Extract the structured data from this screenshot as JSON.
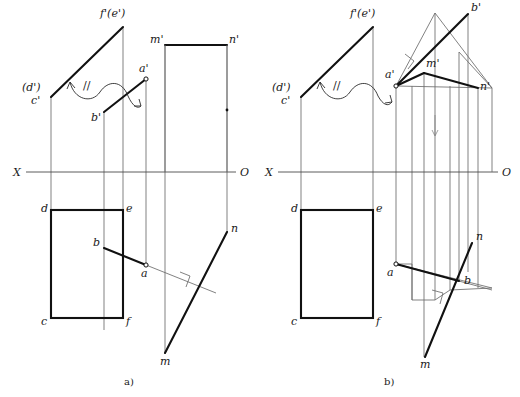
{
  "figure": {
    "width": 520,
    "height": 397,
    "background": "#ffffff",
    "line_color": "#111111",
    "thin_line_color": "#6b6b6b",
    "axis_color": "#4a4a4a"
  },
  "panels": [
    {
      "id": "a",
      "caption": "a)",
      "caption_pos": {
        "x": 124,
        "y": 385
      },
      "axis": {
        "label_left": "X",
        "label_right": "O",
        "label_left_pos": {
          "x": 13,
          "y": 176
        },
        "label_right_pos": {
          "x": 240,
          "y": 176
        },
        "y": 172,
        "x_start": 26,
        "x_end": 236
      },
      "points": [
        {
          "name": "f'(e')",
          "x": 123,
          "y": 27,
          "label_x": 100,
          "label_y": 17,
          "marker": "none"
        },
        {
          "name": "(d')",
          "x": 51,
          "y": 90,
          "label_x": 22,
          "label_y": 91,
          "marker": "none"
        },
        {
          "name": "c'",
          "x": 51,
          "y": 97,
          "label_x": 31,
          "label_y": 104,
          "marker": "none"
        },
        {
          "name": "a'",
          "x": 146,
          "y": 79,
          "label_x": 139,
          "label_y": 72,
          "marker": "open"
        },
        {
          "name": "b'",
          "x": 104,
          "y": 112,
          "label_x": 91,
          "label_y": 121,
          "marker": "none"
        },
        {
          "name": "m'",
          "x": 165,
          "y": 45,
          "label_x": 150,
          "label_y": 43,
          "marker": "none"
        },
        {
          "name": "n'",
          "x": 227,
          "y": 45,
          "label_x": 229,
          "label_y": 43,
          "marker": "none"
        },
        {
          "name": "d",
          "x": 51,
          "y": 210,
          "label_x": 41,
          "label_y": 212,
          "marker": "none"
        },
        {
          "name": "e",
          "x": 123,
          "y": 210,
          "label_x": 126,
          "label_y": 212,
          "marker": "none"
        },
        {
          "name": "c",
          "x": 51,
          "y": 318,
          "label_x": 41,
          "label_y": 325,
          "marker": "none"
        },
        {
          "name": "f",
          "x": 123,
          "y": 318,
          "label_x": 126,
          "label_y": 325,
          "marker": "none"
        },
        {
          "name": "b",
          "x": 104,
          "y": 248,
          "label_x": 93,
          "label_y": 246,
          "marker": "none"
        },
        {
          "name": "a",
          "x": 146,
          "y": 265,
          "label_x": 141,
          "label_y": 277,
          "marker": "open"
        },
        {
          "name": "n",
          "x": 227,
          "y": 232,
          "label_x": 231,
          "label_y": 232,
          "marker": "none"
        },
        {
          "name": "m",
          "x": 165,
          "y": 353,
          "label_x": 160,
          "label_y": 365,
          "marker": "none"
        }
      ],
      "parallel_mark": {
        "symbol": "//",
        "x": 83,
        "y": 86
      }
    },
    {
      "id": "b",
      "caption": "b)",
      "caption_pos": {
        "x": 384,
        "y": 385
      },
      "axis": {
        "label_left": "X",
        "label_right": "O",
        "label_left_pos": {
          "x": 265,
          "y": 176
        },
        "label_right_pos": {
          "x": 502,
          "y": 176
        },
        "y": 172,
        "x_start": 278,
        "x_end": 498
      },
      "points": [
        {
          "name": "f'(e')",
          "x": 373,
          "y": 27,
          "label_x": 350,
          "label_y": 17,
          "marker": "none"
        },
        {
          "name": "(d')",
          "x": 301,
          "y": 90,
          "label_x": 272,
          "label_y": 91,
          "marker": "none"
        },
        {
          "name": "c'",
          "x": 301,
          "y": 97,
          "label_x": 281,
          "label_y": 104,
          "marker": "none"
        },
        {
          "name": "a'",
          "x": 396,
          "y": 86,
          "label_x": 385,
          "label_y": 78,
          "marker": "open"
        },
        {
          "name": "b'",
          "x": 468,
          "y": 14,
          "label_x": 471,
          "label_y": 11,
          "marker": "none"
        },
        {
          "name": "m'",
          "x": 424,
          "y": 73,
          "label_x": 426,
          "label_y": 67,
          "marker": "none"
        },
        {
          "name": "n'",
          "x": 478,
          "y": 88,
          "label_x": 480,
          "label_y": 90,
          "marker": "none"
        },
        {
          "name": "d",
          "x": 301,
          "y": 210,
          "label_x": 291,
          "label_y": 212,
          "marker": "none"
        },
        {
          "name": "e",
          "x": 373,
          "y": 210,
          "label_x": 376,
          "label_y": 212,
          "marker": "none"
        },
        {
          "name": "c",
          "x": 301,
          "y": 318,
          "label_x": 291,
          "label_y": 325,
          "marker": "none"
        },
        {
          "name": "f",
          "x": 373,
          "y": 318,
          "label_x": 376,
          "label_y": 325,
          "marker": "none"
        },
        {
          "name": "a",
          "x": 396,
          "y": 264,
          "label_x": 387,
          "label_y": 276,
          "marker": "open"
        },
        {
          "name": "b",
          "x": 459,
          "y": 281,
          "label_x": 464,
          "label_y": 284,
          "marker": "none"
        },
        {
          "name": "n",
          "x": 472,
          "y": 243,
          "label_x": 476,
          "label_y": 240,
          "marker": "none"
        },
        {
          "name": "m",
          "x": 425,
          "y": 357,
          "label_x": 420,
          "label_y": 368,
          "marker": "none"
        }
      ],
      "parallel_mark": {
        "symbol": "//",
        "x": 333,
        "y": 86
      }
    }
  ],
  "notes": {
    "right_angle_marks": 4,
    "projection_lines": "thin vertical projectors connect front view (above X-O) and top view (below X-O)"
  }
}
